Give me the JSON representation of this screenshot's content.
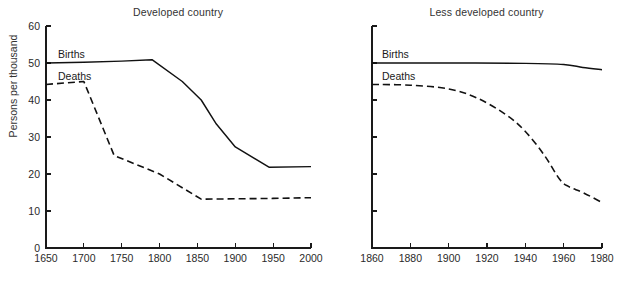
{
  "figure": {
    "background": "#ffffff",
    "line_color": "#111111",
    "text_color": "#1a1a1a",
    "width": 629,
    "height": 281
  },
  "panels": {
    "left": {
      "title": "Developed country",
      "ylabel": "Persons per thousand",
      "births_label": "Births",
      "deaths_label": "Deaths"
    },
    "right": {
      "title": "Less developed country",
      "ylabel": "",
      "births_label": "Births",
      "deaths_label": "Deaths"
    }
  },
  "chart_data": [
    {
      "type": "line",
      "title": "Developed country",
      "xlabel": "",
      "ylabel": "Persons per thousand",
      "xlim": [
        1650,
        2000
      ],
      "ylim": [
        0,
        60
      ],
      "xticks": [
        1650,
        1700,
        1750,
        1800,
        1850,
        1900,
        1950,
        2000
      ],
      "xticklabels": [
        "1650",
        "1700",
        "1750",
        "1800",
        "1850",
        "1900",
        "1950",
        "2000"
      ],
      "yticks": [
        0,
        10,
        20,
        30,
        40,
        50,
        60
      ],
      "yticklabels": [
        "0",
        "10",
        "20",
        "30",
        "40",
        "50",
        "60"
      ],
      "grid": false,
      "legend": "inline-labels",
      "series": [
        {
          "name": "Births",
          "style": "solid",
          "x": [
            1650,
            1700,
            1750,
            1790,
            1830,
            1855,
            1875,
            1900,
            1945,
            2000
          ],
          "values": [
            50.0,
            50.2,
            50.5,
            50.9,
            45.0,
            40.0,
            33.5,
            27.3,
            21.8,
            22.0
          ]
        },
        {
          "name": "Deaths",
          "style": "dashed",
          "x": [
            1650,
            1700,
            1740,
            1800,
            1855,
            1950,
            2000
          ],
          "values": [
            44.2,
            45.0,
            25.0,
            20.0,
            13.2,
            13.4,
            13.6
          ]
        }
      ]
    },
    {
      "type": "line",
      "title": "Less developed country",
      "xlabel": "",
      "ylabel": "",
      "xlim": [
        1860,
        1980
      ],
      "ylim": [
        0,
        60
      ],
      "xticks": [
        1860,
        1880,
        1900,
        1920,
        1940,
        1960,
        1980
      ],
      "xticklabels": [
        "1860",
        "1880",
        "1900",
        "1920",
        "1940",
        "1960",
        "1980"
      ],
      "yticks": [
        0,
        10,
        20,
        30,
        40,
        50,
        60
      ],
      "yticklabels": [
        "",
        "",
        "",
        "",
        "",
        "",
        ""
      ],
      "grid": false,
      "legend": "inline-labels",
      "series": [
        {
          "name": "Births",
          "style": "solid",
          "x": [
            1860,
            1900,
            1940,
            1960,
            1970,
            1980
          ],
          "values": [
            50.0,
            50.0,
            49.9,
            49.6,
            48.8,
            48.2
          ]
        },
        {
          "name": "Deaths",
          "style": "dashed",
          "x": [
            1860,
            1880,
            1900,
            1915,
            1930,
            1940,
            1950,
            1958,
            1963,
            1970,
            1980
          ],
          "values": [
            44.2,
            44.0,
            43.0,
            40.5,
            36.0,
            31.5,
            25.0,
            18.5,
            16.5,
            15.0,
            12.3
          ]
        }
      ]
    }
  ]
}
